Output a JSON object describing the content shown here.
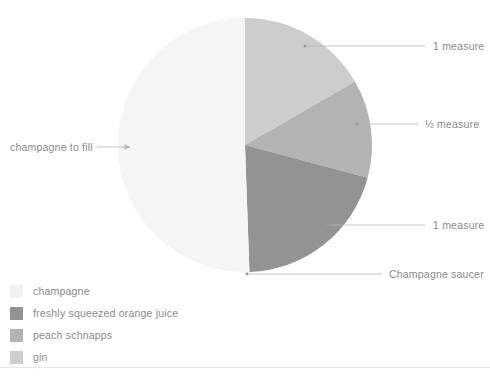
{
  "chart_data": {
    "type": "pie",
    "title": "",
    "subtitle": "",
    "xlabel": "",
    "ylabel": "",
    "grid": false,
    "legend_position": "bottom-left",
    "center": {
      "cx": 245,
      "cy": 145,
      "r": 127
    },
    "start_angle_deg": 0,
    "direction": "clockwise",
    "categories": [
      "gin",
      "peach schnapps",
      "freshly squeezed orange juice",
      "champagne"
    ],
    "values": [
      16.7,
      12.5,
      20.3,
      50.5
    ],
    "slices": [
      {
        "name": "gin",
        "value": 16.7,
        "color": "#cdcdcd",
        "start_deg": 0,
        "end_deg": 60,
        "callout": "1 measure"
      },
      {
        "name": "peach schnapps",
        "value": 12.5,
        "color": "#b3b3b3",
        "start_deg": 60,
        "end_deg": 105,
        "callout": "½ measure"
      },
      {
        "name": "freshly squeezed orange juice",
        "value": 20.3,
        "color": "#939393",
        "start_deg": 105,
        "end_deg": 178,
        "callout": "1 measure"
      },
      {
        "name": "champagne",
        "value": 50.5,
        "color": "#f5f5f3",
        "start_deg": 178,
        "end_deg": 360,
        "callout": "champagne to fill"
      }
    ]
  },
  "callouts": {
    "gin_measure": "1 measure",
    "schnapps_measure": "½ measure",
    "orange_juice_measure": "1 measure",
    "glassware": "Champagne saucer",
    "champagne_fill": "champagne to fill"
  },
  "legend": {
    "items": [
      {
        "label": "champagne",
        "color": "#f2f2f0"
      },
      {
        "label": "freshly squeezed orange juice",
        "color": "#939393"
      },
      {
        "label": "peach schnapps",
        "color": "#b3b3b3"
      },
      {
        "label": "gin",
        "color": "#cdcdcd"
      }
    ]
  },
  "colors": {
    "leader_line": "#b9b9b9",
    "text": "#8a8a8a",
    "rule": "#e8e8e8",
    "background": "#ffffff"
  }
}
